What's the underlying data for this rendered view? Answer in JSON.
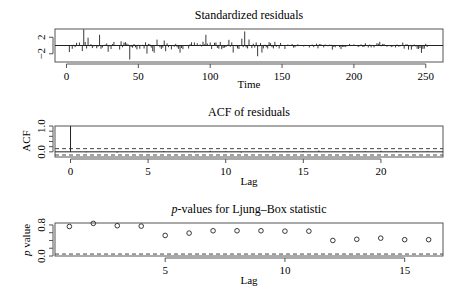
{
  "chart_data": [
    {
      "type": "bar",
      "title": "Standardized residuals",
      "xlabel": "Time",
      "ylabel": "",
      "xlim": [
        -8,
        262
      ],
      "ylim": [
        -4,
        4
      ],
      "x_ticks": [
        0,
        50,
        100,
        150,
        200,
        250
      ],
      "y_ticks": [
        -2,
        2
      ],
      "y_tick_labels": [
        "−2",
        "2"
      ],
      "n": 253,
      "notable_spikes": [
        {
          "x": 12,
          "y": 3.9
        },
        {
          "x": 23,
          "y": 2.6
        },
        {
          "x": 44,
          "y": -3.4
        },
        {
          "x": 97,
          "y": 2.6
        },
        {
          "x": 124,
          "y": 3.4
        },
        {
          "x": 133,
          "y": -2.6
        },
        {
          "x": 247,
          "y": -1.8
        }
      ],
      "reference_line": 0
    },
    {
      "type": "bar",
      "title": "ACF of residuals",
      "xlabel": "Lag",
      "ylabel": "ACF",
      "xlim": [
        -1,
        24
      ],
      "ylim": [
        -0.2,
        1.0
      ],
      "x_ticks": [
        0,
        5,
        10,
        15,
        20
      ],
      "y_ticks": [
        0.0,
        1.0
      ],
      "y_tick_labels": [
        "0.0",
        "1.0"
      ],
      "lags": [
        0,
        1,
        2,
        3,
        4,
        5,
        6,
        7,
        8,
        9,
        10,
        11,
        12,
        13,
        14,
        15,
        16,
        17,
        18,
        19,
        20,
        21,
        22,
        23
      ],
      "values": [
        1.0,
        -0.02,
        0.01,
        -0.03,
        0.02,
        -0.01,
        0.03,
        0.01,
        -0.02,
        0.04,
        0.02,
        -0.03,
        0.01,
        0.02,
        -0.01,
        0.03,
        0.05,
        0.01,
        -0.02,
        0.02,
        0.04,
        0.03,
        -0.01,
        0.02
      ],
      "confidence_bounds": [
        -0.123,
        0.123
      ],
      "bound_style": "dashed"
    },
    {
      "type": "scatter",
      "title": "p-values for Ljung–Box statistic",
      "title_italic_prefix": "p",
      "title_rest": "-values for Ljung–Box statistic",
      "xlabel": "Lag",
      "ylabel": "p value",
      "ylabel_italic_prefix": "p",
      "ylabel_rest": " value",
      "xlim": [
        0.4,
        16.6
      ],
      "ylim": [
        0.0,
        0.85
      ],
      "x_ticks": [
        5,
        10,
        15
      ],
      "y_ticks": [
        0.0,
        0.8
      ],
      "y_tick_labels": [
        "0.0",
        "0.8"
      ],
      "x": [
        1,
        2,
        3,
        4,
        5,
        6,
        7,
        8,
        9,
        10,
        11,
        12,
        13,
        14,
        15,
        16
      ],
      "values": [
        0.76,
        0.84,
        0.78,
        0.77,
        0.53,
        0.59,
        0.65,
        0.65,
        0.65,
        0.64,
        0.64,
        0.4,
        0.43,
        0.46,
        0.42,
        0.42
      ],
      "reference_line": 0.05,
      "reference_style": "dashed",
      "marker": "open-circle"
    }
  ]
}
